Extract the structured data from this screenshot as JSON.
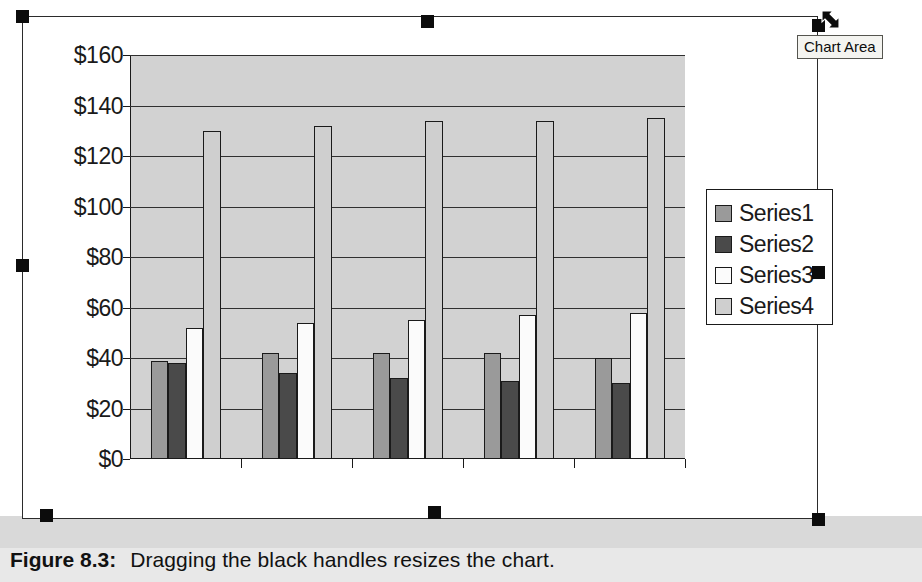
{
  "figure": {
    "label": "Figure 8.3:",
    "text": "Dragging the black handles resizes the chart."
  },
  "tooltip": {
    "text": "Chart Area",
    "cursor_icon": "resize-diagonal-cursor"
  },
  "selection": {
    "handle_count": 8,
    "handle_color": "#0c0c0c",
    "handle_names": [
      "handle-top-left",
      "handle-top-center",
      "handle-top-right",
      "handle-middle-left",
      "handle-middle-right",
      "handle-bottom-left",
      "handle-bottom-center",
      "handle-bottom-right"
    ]
  },
  "chart_data": {
    "type": "bar",
    "title": "",
    "xlabel": "",
    "ylabel": "",
    "categories": [
      "Qtr 4",
      "Qtr 5",
      "Qtr 6",
      "Qtr 7",
      "Qtr 8"
    ],
    "ytick_labels": [
      "$0",
      "$20",
      "$40",
      "$60",
      "$80",
      "$100",
      "$120",
      "$140",
      "$160"
    ],
    "ytick_values": [
      0,
      20,
      40,
      60,
      80,
      100,
      120,
      140,
      160
    ],
    "ylim": [
      0,
      160
    ],
    "grid": true,
    "legend_position": "right",
    "plot_area_color": "#d2d2d2",
    "series": [
      {
        "name": "Series1",
        "color": "#9a9a9a",
        "values": [
          39,
          42,
          42,
          42,
          40
        ]
      },
      {
        "name": "Series2",
        "color": "#4a4a4a",
        "values": [
          38,
          34,
          32,
          31,
          30
        ]
      },
      {
        "name": "Series3",
        "color": "#fbfbfb",
        "values": [
          52,
          54,
          55,
          57,
          58
        ]
      },
      {
        "name": "Series4",
        "color": "#cfcfcf",
        "values": [
          130,
          132,
          134,
          134,
          135
        ]
      }
    ]
  }
}
